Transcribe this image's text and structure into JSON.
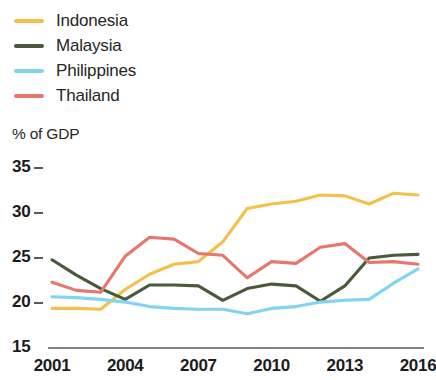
{
  "legend": {
    "position": "top-left",
    "items": [
      {
        "label": "Indonesia",
        "color": "#f5c04a"
      },
      {
        "label": "Malaysia",
        "color": "#4a5939"
      },
      {
        "label": "Philippines",
        "color": "#7fd4f0"
      },
      {
        "label": "Thailand",
        "color": "#e8766a"
      }
    ]
  },
  "axis": {
    "y_title": "% of GDP",
    "y_ticks": [
      "35",
      "30",
      "25",
      "20",
      "15"
    ],
    "x_ticks": [
      "2001",
      "2004",
      "2007",
      "2010",
      "2013",
      "2016"
    ]
  },
  "chart_data": {
    "type": "line",
    "title": "",
    "subtitle": "",
    "xlabel": "",
    "ylabel": "% of GDP",
    "xlim": [
      2001,
      2016
    ],
    "ylim": [
      15,
      35
    ],
    "grid": false,
    "legend_position": "top-left",
    "x": [
      2001,
      2002,
      2003,
      2004,
      2005,
      2006,
      2007,
      2008,
      2009,
      2010,
      2011,
      2012,
      2013,
      2014,
      2015,
      2016
    ],
    "x_tick_labels": [
      "2001",
      "2004",
      "2007",
      "2010",
      "2013",
      "2016"
    ],
    "y_tick_labels": [
      "15",
      "20",
      "25",
      "30",
      "35"
    ],
    "series": [
      {
        "name": "Indonesia",
        "color": "#f5c04a",
        "values": [
          19.4,
          19.4,
          19.3,
          21.5,
          23.2,
          24.3,
          24.6,
          26.8,
          30.5,
          31.0,
          31.3,
          32.0,
          31.9,
          31.0,
          32.2,
          32.0
        ]
      },
      {
        "name": "Malaysia",
        "color": "#4a5939",
        "values": [
          24.8,
          23.1,
          21.6,
          20.4,
          22.0,
          22.0,
          21.9,
          20.3,
          21.6,
          22.1,
          21.9,
          20.2,
          21.9,
          25.0,
          25.3,
          25.4
        ]
      },
      {
        "name": "Philippines",
        "color": "#7fd4f0",
        "values": [
          20.7,
          20.6,
          20.4,
          20.1,
          19.6,
          19.4,
          19.3,
          19.3,
          18.8,
          19.4,
          19.6,
          20.1,
          20.3,
          20.4,
          22.2,
          23.8
        ]
      },
      {
        "name": "Thailand",
        "color": "#e8766a",
        "values": [
          22.3,
          21.4,
          21.2,
          25.2,
          27.3,
          27.1,
          25.5,
          25.3,
          22.8,
          24.6,
          24.4,
          26.2,
          26.6,
          24.5,
          24.6,
          24.3
        ]
      }
    ]
  }
}
